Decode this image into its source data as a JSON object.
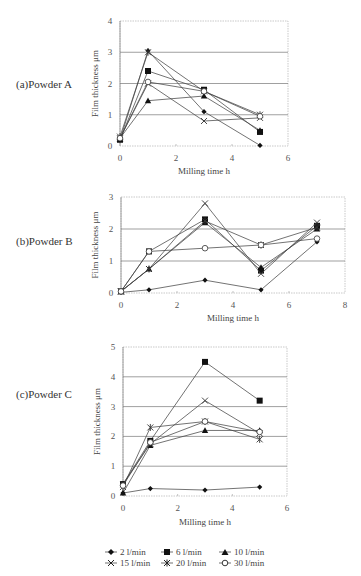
{
  "figure": {
    "panels": [
      {
        "label": "(a)Powder A"
      },
      {
        "label": "(b)Powder B"
      },
      {
        "label": "(c)Powder C"
      }
    ],
    "ylabel": "Film thickness μm",
    "xlabel": "Milling time h"
  },
  "legend": {
    "items": [
      {
        "label": "2 l/min",
        "marker": "diamond"
      },
      {
        "label": "6 l/min",
        "marker": "square"
      },
      {
        "label": "10 l/min",
        "marker": "triangle"
      },
      {
        "label": "15 l/min",
        "marker": "x"
      },
      {
        "label": "20 l/min",
        "marker": "asterisk"
      },
      {
        "label": "30 l/min",
        "marker": "circle"
      }
    ]
  },
  "chart_data": [
    {
      "type": "line",
      "title": "(a)Powder A",
      "xlabel": "Milling time h",
      "ylabel": "Film thickness μm",
      "x": [
        0,
        1,
        3,
        5
      ],
      "xlim": [
        0,
        6
      ],
      "ylim": [
        0,
        4
      ],
      "xticks": [
        0,
        2,
        4,
        6
      ],
      "yticks": [
        0,
        1,
        2,
        3,
        4
      ],
      "grid": "horizontal",
      "legend_position": "bottom",
      "series": [
        {
          "name": "2 l/min",
          "marker": "diamond",
          "values": [
            0.2,
            3.05,
            1.1,
            0.02
          ]
        },
        {
          "name": "6 l/min",
          "marker": "square",
          "values": [
            0.2,
            2.4,
            1.8,
            0.45
          ]
        },
        {
          "name": "10 l/min",
          "marker": "triangle",
          "values": [
            0.25,
            1.45,
            1.6,
            0.5
          ]
        },
        {
          "name": "15 l/min",
          "marker": "x",
          "values": [
            0.25,
            2.0,
            0.8,
            0.9
          ]
        },
        {
          "name": "20 l/min",
          "marker": "asterisk",
          "values": [
            0.3,
            3.0,
            1.75,
            1.0
          ]
        },
        {
          "name": "30 l/min",
          "marker": "circle",
          "values": [
            0.25,
            2.05,
            1.75,
            0.95
          ]
        }
      ]
    },
    {
      "type": "line",
      "title": "(b)Powder B",
      "xlabel": "Milling time h",
      "ylabel": "Film thickness μm",
      "x": [
        0,
        1,
        3,
        5,
        7
      ],
      "xlim": [
        0,
        8
      ],
      "ylim": [
        0,
        3
      ],
      "xticks": [
        0,
        2,
        4,
        6,
        8
      ],
      "yticks": [
        0,
        1,
        2,
        3
      ],
      "grid": "horizontal",
      "legend_position": "bottom",
      "series": [
        {
          "name": "2 l/min",
          "marker": "diamond",
          "values": [
            0.02,
            0.1,
            0.4,
            0.1,
            1.6
          ]
        },
        {
          "name": "6 l/min",
          "marker": "square",
          "values": [
            0.05,
            1.3,
            2.3,
            0.7,
            2.1
          ]
        },
        {
          "name": "10 l/min",
          "marker": "triangle",
          "values": [
            0.05,
            0.75,
            2.2,
            0.8,
            2.0
          ]
        },
        {
          "name": "15 l/min",
          "marker": "x",
          "values": [
            0.05,
            0.75,
            2.8,
            0.6,
            2.2
          ]
        },
        {
          "name": "20 l/min",
          "marker": "asterisk",
          "values": [
            0.05,
            0.75,
            2.25,
            1.5,
            2.05
          ]
        },
        {
          "name": "30 l/min",
          "marker": "circle",
          "values": [
            0.05,
            1.3,
            1.4,
            1.5,
            1.7
          ]
        }
      ]
    },
    {
      "type": "line",
      "title": "(c)Powder C",
      "xlabel": "Milling time h",
      "ylabel": "Film thickness μm",
      "x": [
        0,
        1,
        3,
        5
      ],
      "xlim": [
        0,
        6
      ],
      "ylim": [
        0,
        5
      ],
      "xticks": [
        0,
        2,
        4,
        6
      ],
      "yticks": [
        0,
        1,
        2,
        3,
        4,
        5
      ],
      "grid": "horizontal",
      "legend_position": "bottom",
      "series": [
        {
          "name": "2 l/min",
          "marker": "diamond",
          "values": [
            0.1,
            0.25,
            0.2,
            0.3
          ]
        },
        {
          "name": "6 l/min",
          "marker": "square",
          "values": [
            0.4,
            1.85,
            4.5,
            3.2
          ]
        },
        {
          "name": "10 l/min",
          "marker": "triangle",
          "values": [
            0.1,
            1.7,
            2.2,
            2.2
          ]
        },
        {
          "name": "15 l/min",
          "marker": "x",
          "values": [
            0.4,
            1.75,
            3.2,
            2.1
          ]
        },
        {
          "name": "20 l/min",
          "marker": "asterisk",
          "values": [
            0.3,
            2.3,
            2.5,
            1.9
          ]
        },
        {
          "name": "30 l/min",
          "marker": "circle",
          "values": [
            0.35,
            1.8,
            2.5,
            2.15
          ]
        }
      ]
    }
  ]
}
